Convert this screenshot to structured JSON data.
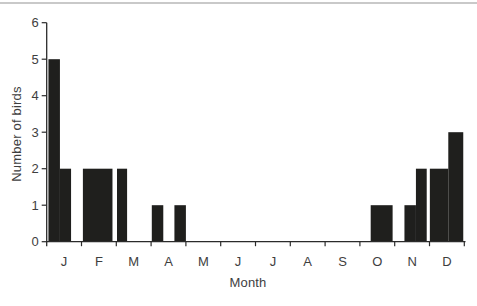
{
  "chart_data": {
    "type": "bar",
    "title": "",
    "xlabel": "Month",
    "ylabel": "Number of birds",
    "ylim": [
      0,
      6
    ],
    "yticks": [
      0,
      1,
      2,
      3,
      4,
      5,
      6
    ],
    "categories": [
      "J",
      "F",
      "M",
      "A",
      "M",
      "J",
      "J",
      "A",
      "S",
      "O",
      "N",
      "D"
    ],
    "grid": false,
    "legend": null,
    "bars": [
      {
        "month": "J",
        "start": 0.05,
        "end": 0.38,
        "value": 5
      },
      {
        "month": "J",
        "start": 0.38,
        "end": 0.7,
        "value": 2
      },
      {
        "month": "F",
        "start": 1.04,
        "end": 1.89,
        "value": 2
      },
      {
        "month": "M",
        "start": 2.02,
        "end": 2.31,
        "value": 2
      },
      {
        "month": "A",
        "start": 3.02,
        "end": 3.35,
        "value": 1
      },
      {
        "month": "A",
        "start": 3.67,
        "end": 4.0,
        "value": 1
      },
      {
        "month": "O",
        "start": 9.31,
        "end": 9.94,
        "value": 1
      },
      {
        "month": "N",
        "start": 10.28,
        "end": 10.61,
        "value": 1
      },
      {
        "month": "N",
        "start": 10.61,
        "end": 10.92,
        "value": 2
      },
      {
        "month": "D",
        "start": 11.01,
        "end": 11.54,
        "value": 2
      },
      {
        "month": "D",
        "start": 11.54,
        "end": 11.97,
        "value": 3
      }
    ],
    "colors": {
      "bar": "#1f1f1d",
      "axis": "#2b2b2b",
      "text": "#3e3e3e",
      "top_rule": "#c9c9c9"
    }
  }
}
